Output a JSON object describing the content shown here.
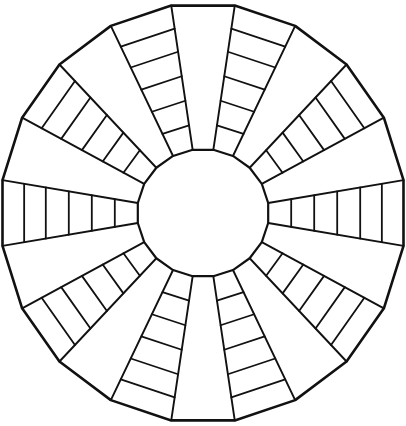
{
  "diagram": {
    "canvas": {
      "width": 406,
      "height": 426,
      "background": "#ffffff"
    },
    "center": {
      "x": 203,
      "y": 213
    },
    "outer_radius": {
      "x": 203,
      "y": 210
    },
    "inner_radius": {
      "x": 66,
      "y": 64
    },
    "sector_count": 20,
    "start_angle_deg": -9,
    "ladder_sectors": "odd",
    "rungs_per_ladder": 5,
    "rung_fractions": [
      0.17,
      0.34,
      0.51,
      0.68,
      0.84
    ],
    "stroke_color": "#111111",
    "outer_stroke_width": 2.6,
    "spoke_stroke_width": 1.9,
    "rung_stroke_width": 1.8,
    "inner_stroke_width": 2.2,
    "sectors": {
      "ladders": 10,
      "blank_wedges": 10
    }
  }
}
